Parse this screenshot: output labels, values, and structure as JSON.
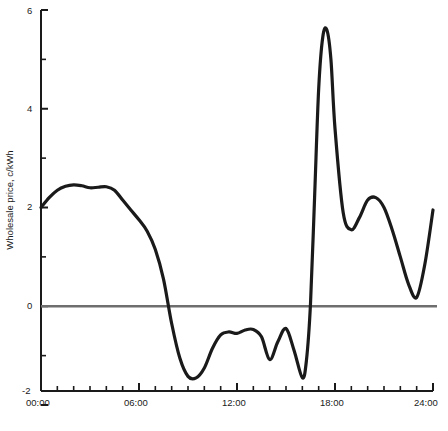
{
  "chart_data": {
    "type": "line",
    "title": "",
    "subtitle": "",
    "xlabel": "",
    "ylabel": "Wholesale price, c/kWh",
    "xlim": [
      0,
      24
    ],
    "ylim": [
      -2,
      6
    ],
    "grid": false,
    "legend": null,
    "zero_line": {
      "value": 0,
      "color": "#6e6e6e",
      "width": 2.5
    },
    "line_color": "#1a1a1a",
    "line_width": 3.2,
    "x_tick_labels": [
      "00:00",
      "06:00",
      "12:00",
      "18:00",
      "24:00"
    ],
    "x_tick_values": [
      0,
      6,
      12,
      18,
      24
    ],
    "x_minor_tick_step": 1,
    "y_tick_labels": [
      "6",
      "4",
      "2",
      "0",
      "-2"
    ],
    "y_tick_values": [
      6,
      4,
      2,
      0,
      -2
    ],
    "y_minor_tick_values": [
      5,
      3,
      1,
      -1
    ],
    "series": [
      {
        "name": "Wholesale price",
        "x": [
          0.0,
          0.5,
          1.0,
          1.5,
          2.0,
          2.5,
          3.0,
          3.5,
          4.0,
          4.5,
          5.0,
          5.5,
          6.0,
          6.5,
          7.0,
          7.5,
          8.0,
          8.5,
          9.0,
          9.5,
          10.0,
          10.5,
          11.0,
          11.5,
          12.0,
          12.5,
          13.0,
          13.5,
          14.0,
          14.5,
          15.0,
          15.5,
          16.0,
          16.25,
          16.5,
          16.75,
          17.0,
          17.25,
          17.5,
          17.75,
          18.0,
          18.5,
          19.0,
          19.5,
          20.0,
          20.5,
          21.0,
          21.5,
          22.0,
          22.5,
          23.0,
          23.5,
          24.0
        ],
        "y": [
          2.0,
          2.2,
          2.35,
          2.43,
          2.46,
          2.44,
          2.4,
          2.41,
          2.42,
          2.35,
          2.15,
          1.95,
          1.75,
          1.52,
          1.15,
          0.55,
          -0.35,
          -1.05,
          -1.42,
          -1.45,
          -1.25,
          -0.85,
          -0.58,
          -0.52,
          -0.55,
          -0.48,
          -0.47,
          -0.62,
          -1.08,
          -0.72,
          -0.45,
          -0.9,
          -1.45,
          -1.1,
          0.05,
          2.2,
          4.4,
          5.45,
          5.6,
          5.0,
          3.6,
          1.9,
          1.55,
          1.8,
          2.15,
          2.2,
          2.0,
          1.55,
          1.0,
          0.45,
          0.18,
          0.85,
          1.95
        ]
      }
    ]
  },
  "axis": {
    "y_axis_label": "Wholesale price, c/kWh"
  }
}
